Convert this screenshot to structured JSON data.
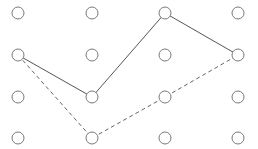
{
  "grid": {
    "columns_x": [
      18,
      92,
      165,
      238
    ],
    "rows_y": [
      13,
      55,
      97,
      138
    ],
    "dot_radius": 6,
    "dot_stroke": "#7a7a7a"
  },
  "paths": {
    "solid": {
      "style": "solid",
      "color": "#555555",
      "points": [
        [
          0,
          1
        ],
        [
          1,
          2
        ],
        [
          2,
          0
        ],
        [
          3,
          1
        ]
      ]
    },
    "dashed": {
      "style": "dashed",
      "color": "#666666",
      "points": [
        [
          0,
          1
        ],
        [
          1,
          3
        ],
        [
          2,
          2
        ],
        [
          3,
          1
        ]
      ]
    }
  }
}
